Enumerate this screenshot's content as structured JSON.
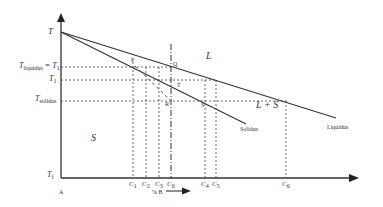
{
  "diagram": {
    "type": "binary phase diagram (solidification)",
    "axes": {
      "y_top_label": "T",
      "y_bottom_label": "Tf",
      "origin_label": "A",
      "x_axis_label": "% B"
    },
    "temperature_levels": [
      {
        "id": "t_liquidus",
        "main": "T",
        "sub": "liquidus",
        "suffix": " = T",
        "suffix_sub": "1"
      },
      {
        "id": "t1",
        "main": "T",
        "sub": "1"
      },
      {
        "id": "t_solidus",
        "main": "T",
        "sub": "solidus"
      }
    ],
    "bottom_temp": {
      "main": "T",
      "sub": "f"
    },
    "regions": {
      "liquid": "L",
      "mushy": "L + S",
      "solid": "S"
    },
    "curves": {
      "solidus": "Solidus",
      "liquidus": "Liquidus"
    },
    "points": [
      "P",
      "Q",
      "T",
      "R",
      "S"
    ],
    "compositions": [
      {
        "main": "C",
        "sub": "1"
      },
      {
        "main": "C",
        "sub": "2"
      },
      {
        "main": "C",
        "sub": "3"
      },
      {
        "main": "C",
        "sub": "0"
      },
      {
        "main": "C",
        "sub": "4"
      },
      {
        "main": "C",
        "sub": "5"
      },
      {
        "main": "C",
        "sub": "6"
      }
    ],
    "colors": {
      "line": "#333333",
      "background": "#ffffff"
    }
  }
}
